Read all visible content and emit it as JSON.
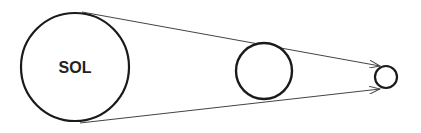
{
  "diagram": {
    "colors": {
      "stroke": "#1a1a1a",
      "line": "#444444",
      "background": "#ffffff"
    },
    "nodes": [
      {
        "id": "sun",
        "label": "SOL",
        "cx": 75,
        "cy": 67,
        "r": 54
      },
      {
        "id": "middle-body",
        "label": "",
        "cx": 264,
        "cy": 71,
        "r": 28
      },
      {
        "id": "small-body",
        "label": "",
        "cx": 386,
        "cy": 77,
        "r": 11
      }
    ],
    "arrows": [
      {
        "from": [
          82,
          12
        ],
        "to": [
          380,
          66
        ]
      },
      {
        "from": [
          80,
          123
        ],
        "to": [
          380,
          89
        ]
      }
    ]
  }
}
